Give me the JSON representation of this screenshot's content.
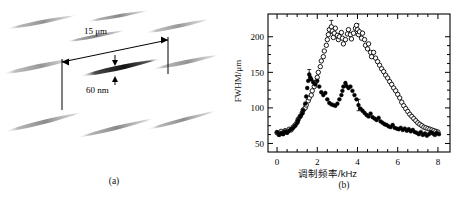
{
  "figure": {
    "panel_a": {
      "caption": "(a)",
      "length_label": "15 μm",
      "diameter_label": "60 nm",
      "description": "schematic of tapered nanowires",
      "wire_color_light": "#b6b6b6",
      "wire_color_dark": "#2b2b2b",
      "wires": [
        {
          "cx": 42,
          "cy": 22,
          "len": 76,
          "th": 5.0,
          "rot": -11,
          "shade": 0.55
        },
        {
          "cx": 118,
          "cy": 16,
          "len": 66,
          "th": 4.4,
          "rot": -10,
          "shade": 0.62
        },
        {
          "cx": 178,
          "cy": 26,
          "len": 70,
          "th": 5.0,
          "rot": -12,
          "shade": 0.5
        },
        {
          "cx": 96,
          "cy": 36,
          "len": 64,
          "th": 4.0,
          "rot": -11,
          "shade": 0.7
        },
        {
          "cx": 40,
          "cy": 66,
          "len": 80,
          "th": 6.0,
          "rot": -12,
          "shade": 0.52
        },
        {
          "cx": 186,
          "cy": 62,
          "len": 72,
          "th": 5.4,
          "rot": -12,
          "shade": 0.55
        },
        {
          "cx": 126,
          "cy": 66,
          "len": 78,
          "th": 5.6,
          "rot": -12,
          "shade": 0.58
        },
        {
          "cx": 44,
          "cy": 122,
          "len": 84,
          "th": 5.6,
          "rot": -14,
          "shade": 0.6
        },
        {
          "cx": 116,
          "cy": 128,
          "len": 84,
          "th": 5.2,
          "rot": -14,
          "shade": 0.62
        },
        {
          "cx": 182,
          "cy": 120,
          "len": 76,
          "th": 4.6,
          "rot": -15,
          "shade": 0.58
        }
      ],
      "highlight_wire": {
        "cx": 118,
        "cy": 68,
        "len": 80,
        "th": 6.4,
        "rot": -12
      }
    },
    "panel_b": {
      "caption": "(b)"
    }
  },
  "chart_data": {
    "type": "scatter",
    "title": "",
    "xlabel": "调制频率/kHz",
    "ylabel": "FWHM/μm",
    "xlim": [
      -0.45,
      8.6
    ],
    "ylim": [
      38,
      232
    ],
    "xticks": [
      0,
      2,
      4,
      6,
      8
    ],
    "yticks": [
      50,
      100,
      150,
      200
    ],
    "xminor_step": 0.5,
    "yminor_step": 12.5,
    "grid": false,
    "legend": null,
    "frame": "box",
    "tick_direction": "in",
    "series": [
      {
        "name": "open-circles",
        "marker": "open-circle",
        "color": "#000000",
        "points": [
          [
            0.0,
            65
          ],
          [
            0.1,
            63
          ],
          [
            0.2,
            67
          ],
          [
            0.3,
            64
          ],
          [
            0.4,
            68
          ],
          [
            0.5,
            66
          ],
          [
            0.6,
            70
          ],
          [
            0.7,
            69
          ],
          [
            0.8,
            73
          ],
          [
            0.9,
            76
          ],
          [
            1.0,
            80
          ],
          [
            1.05,
            84
          ],
          [
            1.15,
            88
          ],
          [
            1.25,
            93
          ],
          [
            1.3,
            97
          ],
          [
            1.4,
            100
          ],
          [
            1.45,
            104
          ],
          [
            1.55,
            110
          ],
          [
            1.6,
            114
          ],
          [
            1.7,
            118
          ],
          [
            1.75,
            124
          ],
          [
            1.85,
            130
          ],
          [
            1.9,
            136
          ],
          [
            2.0,
            143
          ],
          [
            2.05,
            150
          ],
          [
            2.15,
            158
          ],
          [
            2.2,
            166
          ],
          [
            2.3,
            172
          ],
          [
            2.35,
            180
          ],
          [
            2.45,
            188
          ],
          [
            2.5,
            196
          ],
          [
            2.55,
            203
          ],
          [
            2.6,
            210
          ],
          [
            2.7,
            214
          ],
          [
            2.75,
            208
          ],
          [
            2.8,
            199
          ],
          [
            2.85,
            205
          ],
          [
            2.9,
            212
          ],
          [
            3.0,
            202
          ],
          [
            3.05,
            196
          ],
          [
            3.1,
            200
          ],
          [
            3.2,
            206
          ],
          [
            3.25,
            198
          ],
          [
            3.3,
            190
          ],
          [
            3.4,
            196
          ],
          [
            3.5,
            204
          ],
          [
            3.55,
            210
          ],
          [
            3.65,
            203
          ],
          [
            3.7,
            197
          ],
          [
            3.8,
            205
          ],
          [
            3.9,
            212
          ],
          [
            3.95,
            216
          ],
          [
            4.0,
            210
          ],
          [
            4.05,
            203
          ],
          [
            4.1,
            207
          ],
          [
            4.2,
            198
          ],
          [
            4.25,
            205
          ],
          [
            4.35,
            196
          ],
          [
            4.4,
            188
          ],
          [
            4.5,
            183
          ],
          [
            4.55,
            190
          ],
          [
            4.65,
            178
          ],
          [
            4.7,
            172
          ],
          [
            4.8,
            178
          ],
          [
            4.9,
            170
          ],
          [
            5.0,
            165
          ],
          [
            5.1,
            160
          ],
          [
            5.2,
            155
          ],
          [
            5.3,
            151
          ],
          [
            5.4,
            146
          ],
          [
            5.5,
            142
          ],
          [
            5.6,
            137
          ],
          [
            5.7,
            133
          ],
          [
            5.8,
            128
          ],
          [
            5.9,
            124
          ],
          [
            6.0,
            119
          ],
          [
            6.1,
            114
          ],
          [
            6.2,
            108
          ],
          [
            6.3,
            103
          ],
          [
            6.4,
            99
          ],
          [
            6.5,
            95
          ],
          [
            6.6,
            91
          ],
          [
            6.7,
            88
          ],
          [
            6.8,
            85
          ],
          [
            6.9,
            82
          ],
          [
            7.0,
            79
          ],
          [
            7.1,
            77
          ],
          [
            7.2,
            75
          ],
          [
            7.3,
            73
          ],
          [
            7.4,
            72
          ],
          [
            7.5,
            71
          ],
          [
            7.6,
            70
          ],
          [
            7.7,
            69
          ],
          [
            7.8,
            68
          ],
          [
            7.9,
            67
          ],
          [
            8.0,
            66
          ]
        ]
      },
      {
        "name": "filled-circles",
        "marker": "filled-circle",
        "color": "#000000",
        "points": [
          [
            0.0,
            66
          ],
          [
            0.1,
            62
          ],
          [
            0.2,
            65
          ],
          [
            0.3,
            63
          ],
          [
            0.4,
            67
          ],
          [
            0.5,
            65
          ],
          [
            0.6,
            68
          ],
          [
            0.7,
            70
          ],
          [
            0.8,
            72
          ],
          [
            0.9,
            75
          ],
          [
            1.0,
            79
          ],
          [
            1.05,
            83
          ],
          [
            1.15,
            88
          ],
          [
            1.25,
            92
          ],
          [
            1.3,
            97
          ],
          [
            1.4,
            106
          ],
          [
            1.45,
            116
          ],
          [
            1.5,
            128
          ],
          [
            1.55,
            138
          ],
          [
            1.6,
            147
          ],
          [
            1.65,
            143
          ],
          [
            1.7,
            140
          ],
          [
            1.8,
            136
          ],
          [
            1.9,
            133
          ],
          [
            2.0,
            138
          ],
          [
            2.1,
            130
          ],
          [
            2.2,
            122
          ],
          [
            2.3,
            118
          ],
          [
            2.4,
            121
          ],
          [
            2.5,
            112
          ],
          [
            2.6,
            107
          ],
          [
            2.7,
            105
          ],
          [
            2.8,
            104
          ],
          [
            2.9,
            103
          ],
          [
            3.0,
            106
          ],
          [
            3.1,
            112
          ],
          [
            3.2,
            118
          ],
          [
            3.25,
            124
          ],
          [
            3.3,
            130
          ],
          [
            3.4,
            135
          ],
          [
            3.45,
            131
          ],
          [
            3.55,
            128
          ],
          [
            3.65,
            130
          ],
          [
            3.75,
            124
          ],
          [
            3.85,
            118
          ],
          [
            3.95,
            112
          ],
          [
            4.05,
            104
          ],
          [
            4.15,
            99
          ],
          [
            4.25,
            96
          ],
          [
            4.35,
            93
          ],
          [
            4.45,
            90
          ],
          [
            4.55,
            88
          ],
          [
            4.65,
            92
          ],
          [
            4.75,
            87
          ],
          [
            4.85,
            85
          ],
          [
            4.95,
            83
          ],
          [
            5.05,
            86
          ],
          [
            5.15,
            81
          ],
          [
            5.25,
            79
          ],
          [
            5.35,
            77
          ],
          [
            5.45,
            76
          ],
          [
            5.55,
            74
          ],
          [
            5.65,
            73
          ],
          [
            5.75,
            76
          ],
          [
            5.85,
            72
          ],
          [
            5.95,
            71
          ],
          [
            6.05,
            70
          ],
          [
            6.15,
            72
          ],
          [
            6.25,
            69
          ],
          [
            6.35,
            71
          ],
          [
            6.45,
            68
          ],
          [
            6.55,
            70
          ],
          [
            6.65,
            67
          ],
          [
            6.75,
            69
          ],
          [
            6.85,
            66
          ],
          [
            6.95,
            65
          ],
          [
            7.05,
            63
          ],
          [
            7.15,
            66
          ],
          [
            7.25,
            62
          ],
          [
            7.35,
            64
          ],
          [
            7.45,
            61
          ],
          [
            7.55,
            63
          ],
          [
            7.65,
            66
          ],
          [
            7.75,
            64
          ],
          [
            7.85,
            62
          ],
          [
            7.95,
            65
          ],
          [
            8.05,
            63
          ]
        ]
      }
    ],
    "error_bars": [
      {
        "x": 2.7,
        "y": 214,
        "err": 9
      },
      {
        "x": 4.0,
        "y": 210,
        "err": 8
      },
      {
        "x": 1.6,
        "y": 147,
        "err": 7
      },
      {
        "x": 4.05,
        "y": 104,
        "err": 8
      }
    ]
  }
}
